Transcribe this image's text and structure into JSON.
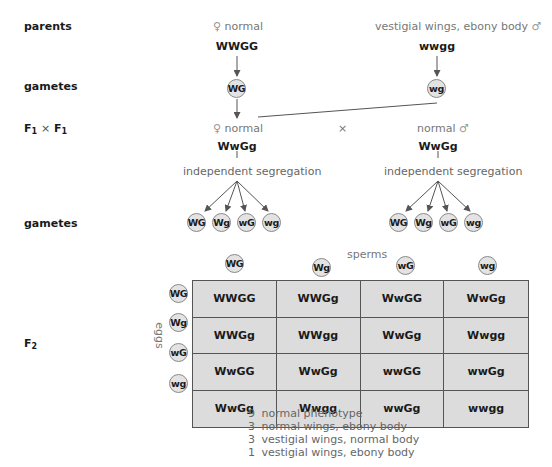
{
  "row_labels": {
    "parents": "parents",
    "gametes_1": "gametes",
    "f1_cross": {
      "a": "F",
      "a_sub": "1",
      "times": "×",
      "b": "F",
      "b_sub": "1"
    },
    "gametes_2": "gametes",
    "f2": {
      "main": "F",
      "sub": "2"
    }
  },
  "parents": {
    "female": {
      "symbol": "♀",
      "phenotype": "normal",
      "genotype": "WWGG",
      "gamete": "WG"
    },
    "male": {
      "phenotype": "vestigial wings, ebony body",
      "symbol": "♂",
      "genotype": "wwgg",
      "gamete": "wg"
    }
  },
  "f1": {
    "female": {
      "symbol": "♀",
      "phenotype": "normal",
      "genotype": "WwGg",
      "process": "independent segregation",
      "gametes": [
        "WG",
        "Wg",
        "wG",
        "wg"
      ]
    },
    "cross_symbol": "×",
    "male": {
      "phenotype": "normal",
      "symbol": "♂",
      "genotype": "WwGg",
      "process": "independent segregation",
      "gametes": [
        "WG",
        "Wg",
        "wG",
        "wg"
      ]
    }
  },
  "punnett": {
    "sperms_label": "sperms",
    "eggs_label": "eggs",
    "sperm_gametes": [
      "WG",
      "Wg",
      "wG",
      "wg"
    ],
    "egg_gametes": [
      "WG",
      "Wg",
      "wG",
      "wg"
    ],
    "cells": [
      [
        "WWGG",
        "WWGg",
        "WwGG",
        "WwGg"
      ],
      [
        "WWGg",
        "WWgg",
        "WwGg",
        "Wwgg"
      ],
      [
        "WwGG",
        "WwGg",
        "wwGG",
        "wwGg"
      ],
      [
        "WwGg",
        "Wwgg",
        "wwGg",
        "wwgg"
      ]
    ]
  },
  "ratio": [
    {
      "count": "9",
      "label": "normal phenotype"
    },
    {
      "count": "3",
      "label": "normal wings, ebony body"
    },
    {
      "count": "3",
      "label": "vestigial wings, normal body"
    },
    {
      "count": "1",
      "label": "vestigial wings, ebony body"
    }
  ],
  "colors": {
    "line": "#555555",
    "gamete_fill": "#e3e3e3",
    "grid_fill": "#dcdcdc",
    "muted_text": "#777777"
  }
}
